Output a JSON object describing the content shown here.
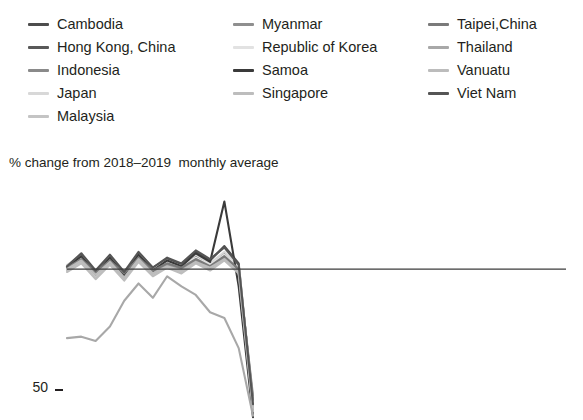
{
  "legend": {
    "columns": [
      {
        "items": [
          {
            "label": "Cambodia",
            "color": "#4d4d4d"
          },
          {
            "label": "Hong Kong, China",
            "color": "#595959"
          },
          {
            "label": "Indonesia",
            "color": "#8a8a8a"
          },
          {
            "label": "Japan",
            "color": "#d8d8d8"
          },
          {
            "label": "Malaysia",
            "color": "#c4c4c4"
          }
        ]
      },
      {
        "items": [
          {
            "label": "Myanmar",
            "color": "#8f8f8f"
          },
          {
            "label": "Republic of Korea",
            "color": "#e2e2e2"
          },
          {
            "label": "Samoa",
            "color": "#3a3a3a"
          },
          {
            "label": "Singapore",
            "color": "#bdbdbd"
          }
        ]
      },
      {
        "items": [
          {
            "label": "Taipei,China",
            "color": "#7a7a7a"
          },
          {
            "label": "Thailand",
            "color": "#a8a8a8"
          },
          {
            "label": "Vanuatu",
            "color": "#bcbcbc"
          },
          {
            "label": "Viet Nam",
            "color": "#555555"
          }
        ]
      }
    ]
  },
  "axis_caption": "% change from 2018–2019  monthly average",
  "yticks": [
    {
      "label": "50",
      "value": 50
    },
    {
      "label": "0",
      "value": 0
    },
    {
      "label": "−50",
      "value": -50
    }
  ],
  "chart_data": {
    "type": "line",
    "title": "",
    "subtitle": "",
    "xlabel": "",
    "ylabel": "% change from 2018–2019  monthly average",
    "ylim": [
      -105,
      62
    ],
    "xlim": [
      0,
      14
    ],
    "grid": false,
    "legend_position": "top",
    "zero_line": true,
    "tick_labels": [
      "50",
      "0",
      "−50"
    ],
    "tick_values": [
      50,
      0,
      -50
    ],
    "x": [
      0,
      1,
      2,
      3,
      4,
      5,
      6,
      7,
      8,
      9,
      10,
      11,
      12,
      13
    ],
    "series": [
      {
        "name": "Cambodia",
        "color": "#4d4d4d",
        "values": [
          2,
          10,
          -2,
          9,
          -3,
          11,
          1,
          7,
          3,
          12,
          6,
          16,
          4,
          -95
        ]
      },
      {
        "name": "Hong Kong, China",
        "color": "#595959",
        "values": [
          0,
          8,
          -4,
          7,
          -5,
          9,
          -2,
          5,
          0,
          9,
          2,
          11,
          0,
          -100
        ]
      },
      {
        "name": "Indonesia",
        "color": "#8a8a8a",
        "values": [
          1,
          6,
          -3,
          6,
          -4,
          7,
          -1,
          4,
          1,
          7,
          3,
          9,
          1,
          -92
        ]
      },
      {
        "name": "Japan",
        "color": "#d8d8d8",
        "values": [
          3,
          9,
          -1,
          8,
          -2,
          10,
          0,
          6,
          2,
          10,
          4,
          12,
          2,
          -90
        ]
      },
      {
        "name": "Malaysia",
        "color": "#c4c4c4",
        "values": [
          -1,
          5,
          -6,
          4,
          -7,
          6,
          -4,
          2,
          -2,
          5,
          0,
          7,
          -2,
          -97
        ]
      },
      {
        "name": "Myanmar",
        "color": "#8f8f8f",
        "values": [
          0,
          7,
          -3,
          5,
          -5,
          8,
          -2,
          3,
          0,
          6,
          1,
          8,
          -1,
          -88
        ]
      },
      {
        "name": "Republic of Korea",
        "color": "#e2e2e2",
        "values": [
          2,
          8,
          -2,
          6,
          -3,
          9,
          0,
          5,
          2,
          8,
          3,
          10,
          1,
          -93
        ]
      },
      {
        "name": "Samoa",
        "color": "#3a3a3a",
        "values": [
          1,
          9,
          -3,
          8,
          -4,
          10,
          -1,
          6,
          2,
          11,
          5,
          47,
          -12,
          -103
        ]
      },
      {
        "name": "Singapore",
        "color": "#bdbdbd",
        "values": [
          -2,
          4,
          -7,
          3,
          -8,
          5,
          -5,
          1,
          -3,
          4,
          -1,
          6,
          -3,
          -99
        ]
      },
      {
        "name": "Taipei,China",
        "color": "#7a7a7a",
        "values": [
          1,
          7,
          -2,
          6,
          -3,
          8,
          -1,
          4,
          1,
          7,
          2,
          9,
          0,
          -91
        ]
      },
      {
        "name": "Thailand",
        "color": "#a8a8a8",
        "values": [
          -48,
          -47,
          -50,
          -40,
          -22,
          -10,
          -20,
          -5,
          -12,
          -18,
          -30,
          -34,
          -55,
          -102
        ]
      },
      {
        "name": "Vanuatu",
        "color": "#bcbcbc",
        "values": [
          0,
          6,
          -4,
          5,
          -6,
          7,
          -3,
          2,
          -1,
          5,
          1,
          7,
          -2,
          -96
        ]
      },
      {
        "name": "Viet Nam",
        "color": "#555555",
        "values": [
          2,
          11,
          -1,
          10,
          -2,
          12,
          1,
          8,
          4,
          13,
          7,
          15,
          3,
          -94
        ]
      }
    ]
  }
}
